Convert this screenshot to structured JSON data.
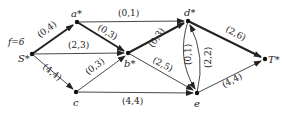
{
  "diagram": {
    "flow_label": "f=6",
    "nodes": [
      {
        "id": "S",
        "label": "S*",
        "x": 32,
        "y": 54
      },
      {
        "id": "a",
        "label": "a*",
        "x": 77,
        "y": 22
      },
      {
        "id": "b",
        "label": "b*",
        "x": 128,
        "y": 53
      },
      {
        "id": "c",
        "label": "c",
        "x": 76,
        "y": 92
      },
      {
        "id": "d",
        "label": "d*",
        "x": 188,
        "y": 21
      },
      {
        "id": "e",
        "label": "e",
        "x": 197,
        "y": 93
      },
      {
        "id": "T",
        "label": "T*",
        "x": 265,
        "y": 59
      }
    ],
    "edges": [
      {
        "from": "S",
        "to": "a",
        "label": "(0,4)",
        "bold": true
      },
      {
        "from": "S",
        "to": "b",
        "label": "(2,3)",
        "bold": false
      },
      {
        "from": "S",
        "to": "c",
        "label": "(4,4)",
        "bold": false
      },
      {
        "from": "a",
        "to": "d",
        "label": "(0,1)",
        "bold": false
      },
      {
        "from": "a",
        "to": "b",
        "label": "(0,3)",
        "bold": true
      },
      {
        "from": "c",
        "to": "b",
        "label": "(0,3)",
        "bold": false
      },
      {
        "from": "c",
        "to": "e",
        "label": "(4,4)",
        "bold": false
      },
      {
        "from": "b",
        "to": "d",
        "label": "(0,3)",
        "bold": true
      },
      {
        "from": "b",
        "to": "e",
        "label": "(2,5)",
        "bold": false
      },
      {
        "from": "d",
        "to": "e",
        "label": "(0,1)",
        "bold": false,
        "curve": "left"
      },
      {
        "from": "e",
        "to": "d",
        "label": "(2,2)",
        "bold": false,
        "curve": "right"
      },
      {
        "from": "d",
        "to": "T",
        "label": "(2,6)",
        "bold": true
      },
      {
        "from": "e",
        "to": "T",
        "label": "(4,4)",
        "bold": false
      }
    ]
  }
}
